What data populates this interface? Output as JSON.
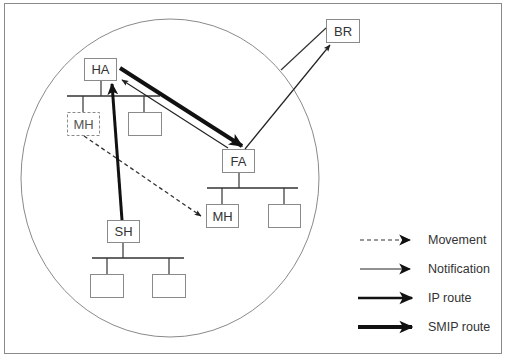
{
  "diagram": {
    "nodes": {
      "ha": {
        "label": "HA"
      },
      "mh_old": {
        "label": "MH",
        "style": "dashed"
      },
      "fa": {
        "label": "FA"
      },
      "mh_new": {
        "label": "MH"
      },
      "sh": {
        "label": "SH"
      },
      "br": {
        "label": "BR"
      }
    },
    "edges": [
      {
        "from": "SH",
        "to": "HA",
        "type": "IP route"
      },
      {
        "from": "HA",
        "to": "FA",
        "type": "SMIP route"
      },
      {
        "from": "FA",
        "to": "HA",
        "type": "Notification"
      },
      {
        "from": "FA",
        "to": "BR",
        "type": "Notification"
      },
      {
        "from": "MH (old)",
        "to": "MH (new)",
        "type": "Movement"
      }
    ],
    "legend": {
      "items": [
        {
          "label": "Movement",
          "style": "dashed"
        },
        {
          "label": "Notification",
          "style": "thin"
        },
        {
          "label": "IP route",
          "style": "thick"
        },
        {
          "label": "SMIP route",
          "style": "thicker"
        }
      ]
    },
    "colors": {
      "frame": "#8a8a8a",
      "circle": "#8a8a8a",
      "box_border": "#8a8a8a",
      "line": "#333333",
      "arrow": "#111111",
      "text": "#333333"
    }
  }
}
